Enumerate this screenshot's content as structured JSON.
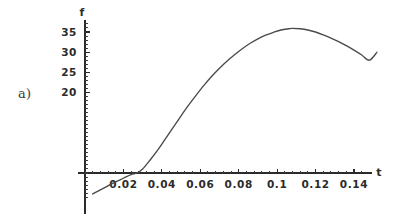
{
  "figure": {
    "panel_label": "a)",
    "background_color": "#ffffff",
    "ink_color": "#2b2b2b",
    "curve_color": "#4a4a4a"
  },
  "chart_data": {
    "type": "line",
    "title": "",
    "subtitle": "",
    "xlabel": "t",
    "ylabel": "f",
    "grid": false,
    "legend": null,
    "xlim": [
      -0.008,
      0.158
    ],
    "ylim": [
      -7,
      38
    ],
    "x_ticks": [
      0.02,
      0.04,
      0.06,
      0.08,
      0.1,
      0.12,
      0.14
    ],
    "x_tick_labels": [
      "0.02",
      "0.04",
      "0.06",
      "0.08",
      "0.1",
      "0.12",
      "0.14"
    ],
    "x_minor_tick_count": 4,
    "y_ticks": [
      20,
      25,
      30,
      35
    ],
    "y_tick_labels": [
      "20",
      "25",
      "30",
      "35"
    ],
    "y_minor_tick_count": 4,
    "annotations": [
      "a)"
    ],
    "series": [
      {
        "name": "f(t)",
        "x": [
          0.004,
          0.008,
          0.012,
          0.016,
          0.02,
          0.024,
          0.027,
          0.03,
          0.034,
          0.038,
          0.042,
          0.046,
          0.05,
          0.054,
          0.058,
          0.062,
          0.066,
          0.07,
          0.074,
          0.078,
          0.082,
          0.086,
          0.09,
          0.094,
          0.098,
          0.102,
          0.106,
          0.108,
          0.112,
          0.116,
          0.12,
          0.124,
          0.128,
          0.132,
          0.136,
          0.14,
          0.144,
          0.148,
          0.152
        ],
        "y": [
          -5.2,
          -4.2,
          -3.2,
          -2.2,
          -1.3,
          -0.4,
          0.0,
          1.0,
          3.3,
          5.8,
          8.6,
          11.4,
          14.2,
          16.9,
          19.4,
          21.8,
          24.0,
          26.0,
          27.8,
          29.4,
          30.9,
          32.2,
          33.3,
          34.2,
          34.9,
          35.5,
          35.8,
          35.9,
          35.8,
          35.5,
          35.0,
          34.3,
          33.5,
          32.6,
          31.6,
          30.5,
          29.3,
          28.0,
          30.0
        ]
      }
    ],
    "peak": {
      "t": 0.108,
      "f": 35.9
    },
    "zero_crossing": {
      "t": 0.027,
      "f": 0
    }
  }
}
